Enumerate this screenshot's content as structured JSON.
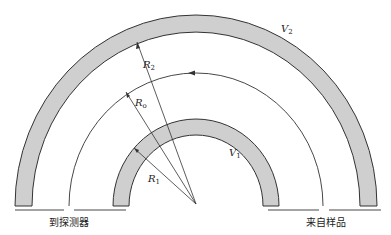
{
  "diagram": {
    "labels": {
      "R2": "R",
      "R2_sub": "2",
      "R0": "R",
      "R0_sub": "o",
      "R1": "R",
      "R1_sub": "1",
      "V2": "V",
      "V2_sub": "2",
      "V1": "V",
      "V1_sub": "1"
    },
    "exit_label": "到探测器",
    "entrance_label": "来自样品",
    "colors": {
      "ring_fill": "#cfcfcf",
      "stroke": "#333333"
    }
  }
}
